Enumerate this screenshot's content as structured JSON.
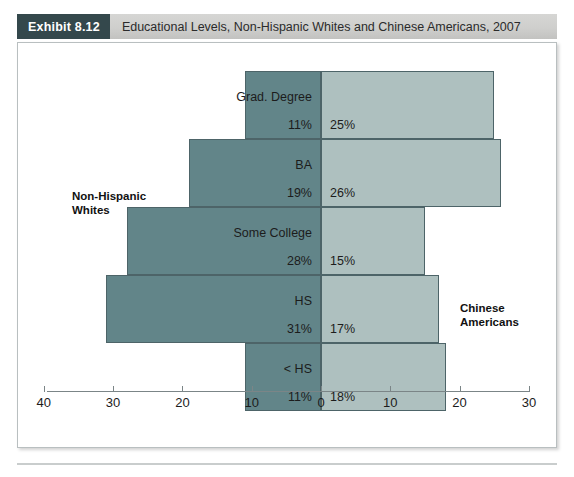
{
  "header": {
    "badge": "Exhibit 8.12",
    "title": "Educational Levels, Non-Hispanic Whites and Chinese Americans, 2007"
  },
  "groups": {
    "left_line1": "Non-Hispanic",
    "left_line2": "Whites",
    "right_line1": "Chinese",
    "right_line2": "Americans"
  },
  "colors": {
    "badge_bg": "#34484c",
    "header_bg": "#cfcfcd",
    "left_bar": "#628589",
    "right_bar": "#aec0bf",
    "bar_border": "#4d6468",
    "axis": "#7b8587",
    "frame_border": "#b9bfc0"
  },
  "chart_data": {
    "type": "bar",
    "title": "Educational Levels, Non-Hispanic Whites and Chinese Americans, 2007",
    "orientation": "horizontal",
    "style": "back-to-back population pyramid",
    "xlabel": "",
    "ylabel": "",
    "grid": false,
    "legend_position": "inline-labels",
    "categories": [
      "Grad. Degree",
      "BA",
      "Some College",
      "HS",
      "< HS"
    ],
    "axis": {
      "left_ticks": [
        40,
        30,
        20,
        10,
        0
      ],
      "right_ticks": [
        0,
        10,
        20,
        30
      ],
      "tick_labels": [
        "40",
        "30",
        "20",
        "10",
        "0",
        "10",
        "20",
        "30"
      ],
      "left_max": 40,
      "right_max": 30,
      "units": "percent"
    },
    "series": [
      {
        "name": "Non-Hispanic Whites",
        "side": "left",
        "values": [
          11,
          19,
          28,
          31,
          11
        ],
        "value_labels": [
          "11%",
          "19%",
          "28%",
          "31%",
          "11%"
        ],
        "color": "#628589"
      },
      {
        "name": "Chinese Americans",
        "side": "right",
        "values": [
          25,
          26,
          15,
          17,
          18
        ],
        "value_labels": [
          "25%",
          "26%",
          "15%",
          "17%",
          "18%"
        ],
        "color": "#aec0bf"
      }
    ]
  }
}
